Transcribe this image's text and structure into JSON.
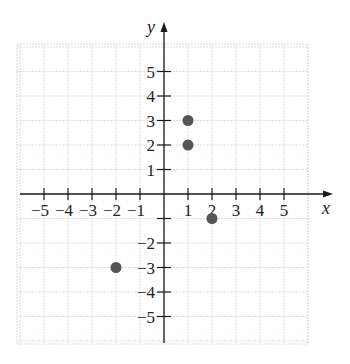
{
  "chart_data": {
    "type": "scatter",
    "title": "",
    "xlabel": "x",
    "ylabel": "y",
    "xlim": [
      -6,
      6
    ],
    "ylim": [
      -6,
      6
    ],
    "grid": true,
    "x_ticks": [
      -5,
      -4,
      -3,
      -2,
      -1,
      1,
      2,
      3,
      4,
      5
    ],
    "y_ticks": [
      -5,
      -4,
      -3,
      -2,
      -1,
      1,
      2,
      3,
      4,
      5
    ],
    "x_tick_labels": [
      "−5",
      "−4",
      "−3",
      "−2",
      "−1",
      "1",
      "2",
      "3",
      "4",
      "5"
    ],
    "y_tick_labels": [
      "−5",
      "−4",
      "−3",
      "−2",
      "",
      "1",
      "2",
      "3",
      "4",
      "5"
    ],
    "series": [
      {
        "name": "points",
        "points": [
          {
            "x": 1,
            "y": 3
          },
          {
            "x": 1,
            "y": 2
          },
          {
            "x": 2,
            "y": -1
          },
          {
            "x": -2,
            "y": -3
          }
        ]
      }
    ],
    "colors": {
      "point": "#555555",
      "axis": "#1a1a1a",
      "grid": "#dcdcdc",
      "grid_minor": "#ececec"
    }
  }
}
